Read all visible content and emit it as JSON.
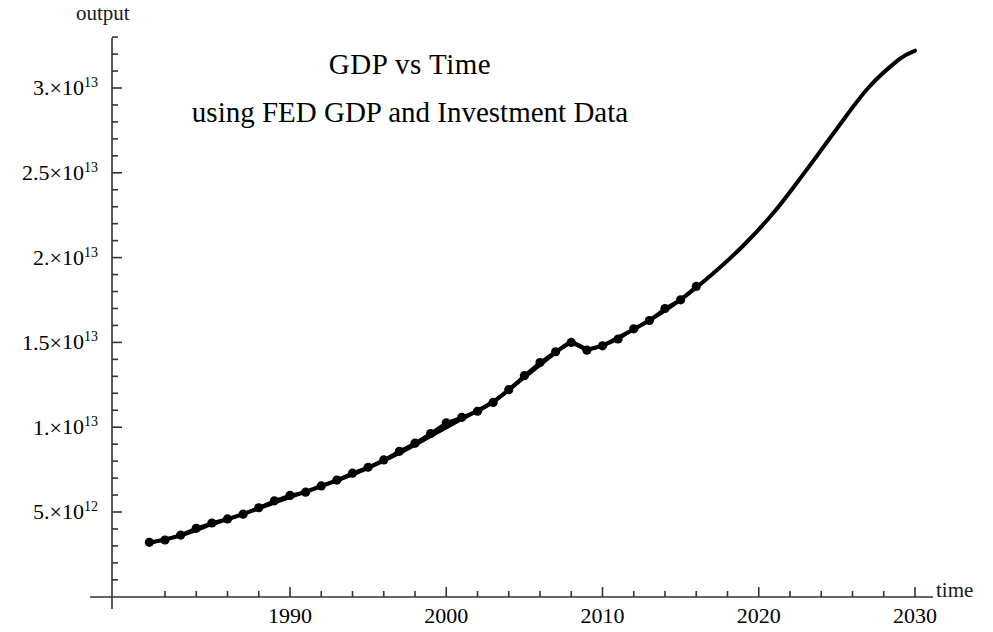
{
  "figure": {
    "title": "GDP  vs  Time",
    "subtitle": "using FED GDP and Investment Data",
    "y_axis_label": "output",
    "x_axis_label": "time",
    "background": "#ffffff",
    "ink": "#000000"
  },
  "y_ticks": [
    {
      "value": 5000000000000.0,
      "mantissa": "5.",
      "times": "×",
      "base": "10",
      "exp": "12"
    },
    {
      "value": 10000000000000.0,
      "mantissa": "1.",
      "times": "×",
      "base": "10",
      "exp": "13"
    },
    {
      "value": 15000000000000.0,
      "mantissa": "1.5",
      "times": "×",
      "base": "10",
      "exp": "13"
    },
    {
      "value": 20000000000000.0,
      "mantissa": "2.",
      "times": "×",
      "base": "10",
      "exp": "13"
    },
    {
      "value": 25000000000000.0,
      "mantissa": "2.5",
      "times": "×",
      "base": "10",
      "exp": "13"
    },
    {
      "value": 30000000000000.0,
      "mantissa": "3.",
      "times": "×",
      "base": "10",
      "exp": "13"
    }
  ],
  "x_ticks": [
    {
      "value": 1990,
      "label": "1990"
    },
    {
      "value": 2000,
      "label": "2000"
    },
    {
      "value": 2010,
      "label": "2010"
    },
    {
      "value": 2020,
      "label": "2020"
    },
    {
      "value": 2030,
      "label": "2030"
    }
  ],
  "chart_data": {
    "type": "scatter",
    "title": "GDP  vs  Time",
    "subtitle": "using FED GDP and Investment Data",
    "xlabel": "time",
    "ylabel": "output",
    "grid": false,
    "legend": "none",
    "xlim": [
      1980.5,
      2031.5
    ],
    "ylim": [
      0,
      33500000000000.0
    ],
    "x_major_ticks": [
      1990,
      2000,
      2010,
      2020,
      2030
    ],
    "x_minor_step": 2,
    "y_major_ticks": [
      5000000000000.0,
      10000000000000.0,
      15000000000000.0,
      20000000000000.0,
      25000000000000.0,
      30000000000000.0
    ],
    "y_minor_divisions": 5,
    "series": [
      {
        "name": "FED GDP data points",
        "type": "scatter",
        "marker": "filled-circle",
        "marker_size": 8,
        "color": "#000000",
        "x": [
          1981,
          1982,
          1983,
          1984,
          1985,
          1986,
          1987,
          1988,
          1989,
          1990,
          1991,
          1992,
          1993,
          1994,
          1995,
          1996,
          1997,
          1998,
          1999,
          2000,
          2001,
          2002,
          2003,
          2004,
          2005,
          2006,
          2007,
          2008,
          2009,
          2010,
          2011,
          2012,
          2013,
          2014,
          2015,
          2016
        ],
        "y": [
          3210000000000.0,
          3350000000000.0,
          3640000000000.0,
          4040000000000.0,
          4350000000000.0,
          4590000000000.0,
          4870000000000.0,
          5250000000000.0,
          5660000000000.0,
          5980000000000.0,
          6170000000000.0,
          6540000000000.0,
          6880000000000.0,
          7290000000000.0,
          7640000000000.0,
          8070000000000.0,
          8580000000000.0,
          9060000000000.0,
          9630000000000.0,
          10250000000000.0,
          10580000000000.0,
          10940000000000.0,
          11460000000000.0,
          12210000000000.0,
          13040000000000.0,
          13810000000000.0,
          14450000000000.0,
          15000000000000.0,
          14540000000000.0,
          14800000000000.0,
          15200000000000.0,
          15800000000000.0,
          16290000000000.0,
          17000000000000.0,
          17510000000000.0,
          18300000000000.0
        ]
      },
      {
        "name": "fitted / projected curve",
        "type": "line",
        "line_width": 4,
        "color": "#000000",
        "x": [
          1981,
          1983,
          1985,
          1987,
          1989,
          1991,
          1993,
          1995,
          1997,
          1999,
          2001,
          2003,
          2005,
          2007,
          2008,
          2009,
          2010,
          2011,
          2013,
          2015,
          2017,
          2019,
          2021,
          2023,
          2025,
          2027,
          2029,
          2030
        ],
        "y": [
          3180000000000.0,
          3620000000000.0,
          4280000000000.0,
          4880000000000.0,
          5560000000000.0,
          6200000000000.0,
          6860000000000.0,
          7600000000000.0,
          8480000000000.0,
          9480000000000.0,
          10500000000000.0,
          11500000000000.0,
          12950000000000.0,
          14400000000000.0,
          14980000000000.0,
          14620000000000.0,
          14820000000000.0,
          15280000000000.0,
          16300000000000.0,
          17520000000000.0,
          19000000000000.0,
          20700000000000.0,
          22700000000000.0,
          25100000000000.0,
          27600000000000.0,
          30000000000000.0,
          31700000000000.0,
          32200000000000.0
        ]
      }
    ],
    "annotations": [
      {
        "text": "2008 recession dip visible in data points",
        "x": 2008.5,
        "y": 14700000000000.0
      }
    ]
  }
}
